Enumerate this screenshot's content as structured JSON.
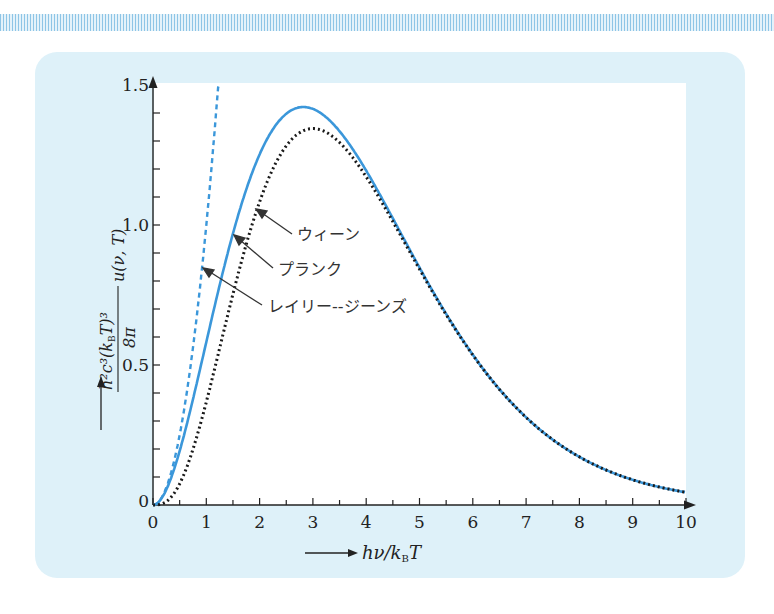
{
  "chart_data": {
    "type": "line",
    "title": "",
    "xlabel": "hν/k_B T",
    "ylabel": "h²c³/(8π(k_B T)³) u(ν,T)",
    "xlim": [
      0,
      10
    ],
    "ylim": [
      0,
      1.5
    ],
    "x_ticks": [
      "0",
      "1",
      "2",
      "3",
      "4",
      "5",
      "6",
      "7",
      "8",
      "9",
      "10"
    ],
    "y_ticks": [
      "0",
      "0.5",
      "1.0",
      "1.5"
    ],
    "grid": false,
    "legend": "inline annotations with arrows",
    "series": [
      {
        "name": "プランク",
        "style": "solid",
        "color": "#3b97da",
        "x": [
          0,
          0.5,
          1,
          1.5,
          2,
          2.5,
          2.82,
          3,
          3.5,
          4,
          4.5,
          5,
          6,
          7,
          8,
          9,
          10
        ],
        "values": [
          0,
          0.193,
          0.582,
          0.976,
          1.252,
          1.396,
          1.421,
          1.415,
          1.337,
          1.194,
          1.018,
          0.842,
          0.54,
          0.32,
          0.179,
          0.09,
          0.045
        ]
      },
      {
        "name": "ウィーン",
        "style": "dotted",
        "color": "#1a1a1a",
        "x": [
          0,
          0.5,
          1,
          1.5,
          2,
          2.5,
          3,
          3.5,
          4,
          4.5,
          5,
          6,
          7,
          8,
          9,
          10
        ],
        "values": [
          0,
          0.076,
          0.368,
          0.753,
          1.083,
          1.282,
          1.344,
          1.294,
          1.172,
          1.012,
          0.842,
          0.535,
          0.313,
          0.172,
          0.09,
          0.045
        ]
      },
      {
        "name": "レイリー-ジーンズ",
        "style": "dashed",
        "color": "#3b97da",
        "x": [
          0,
          0.5,
          1,
          1.22
        ],
        "values": [
          0,
          0.25,
          1.0,
          1.5
        ]
      }
    ],
    "annotations": [
      {
        "text": "ウィーン",
        "points_to_x": 1.9
      },
      {
        "text": "プランク",
        "points_to_x": 1.5
      },
      {
        "text": "レイリー--ジーンズ",
        "points_to_x": 0.95
      }
    ]
  },
  "labels": {
    "x_axis": "hν/k",
    "x_axis_sub": "B",
    "x_axis_tail": "T",
    "y_num": "h²c³(k",
    "y_num_sub": "B",
    "y_num_tail": "T)³",
    "y_den": "8π",
    "y_func": "u(ν, T)",
    "wien": "ウィーン",
    "planck": "プランク",
    "rj": "レイリー--ジーンズ"
  },
  "ticks": {
    "x": [
      "0",
      "1",
      "2",
      "3",
      "4",
      "5",
      "6",
      "7",
      "8",
      "9",
      "10"
    ],
    "y": [
      "0",
      "0.5",
      "1.0",
      "1.5"
    ]
  },
  "colors": {
    "panel": "#def1f9",
    "curve_blue": "#3b97da",
    "curve_black": "#1a1a1a"
  }
}
